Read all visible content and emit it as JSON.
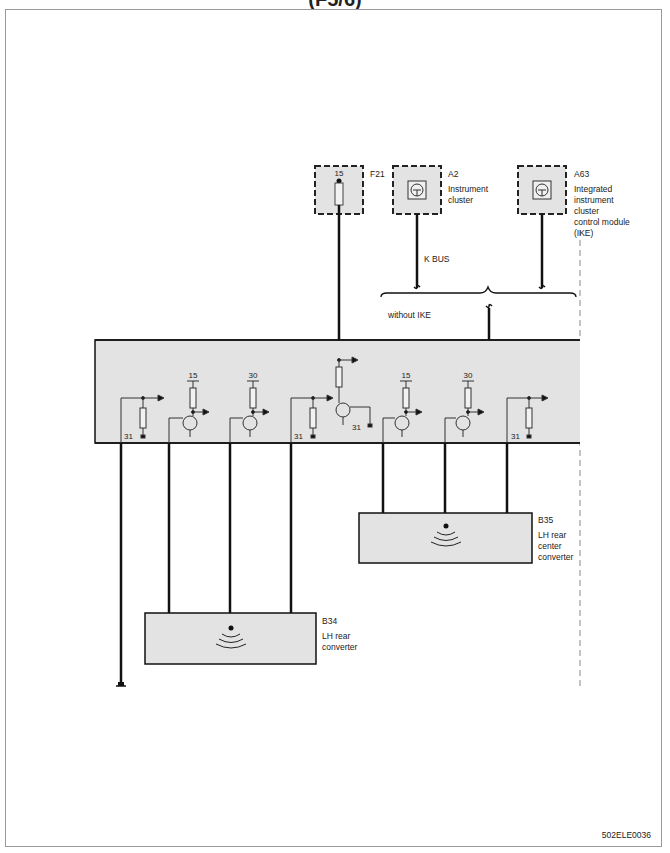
{
  "page": {
    "header_fragment": "(F5/6)",
    "figure_code": "502ELE0036"
  },
  "components": {
    "fuse": {
      "id": "F21",
      "terminal": "15"
    },
    "instrument_cluster": {
      "id": "A2",
      "name_line1": "Instrument",
      "name_line2": "cluster"
    },
    "ike": {
      "id": "A63",
      "name_line1": "Integrated",
      "name_line2": "instrument",
      "name_line3": "cluster",
      "name_line4": "control module",
      "name_line5": "(IKE)"
    },
    "b35": {
      "id": "B35",
      "name_line1": "LH rear",
      "name_line2": "center",
      "name_line3": "converter"
    },
    "b34": {
      "id": "B34",
      "name_line1": "LH rear",
      "name_line2": "converter"
    }
  },
  "wiring": {
    "kbus_label": "K BUS",
    "without_ike_label": "without IKE"
  },
  "control_unit": {
    "terminals": [
      "31",
      "15",
      "30",
      "31",
      "31",
      "15",
      "30",
      "31"
    ]
  },
  "colors": {
    "component_fill": "#e3e3e3",
    "line": "#111111",
    "frame": "#9a9a9a"
  }
}
